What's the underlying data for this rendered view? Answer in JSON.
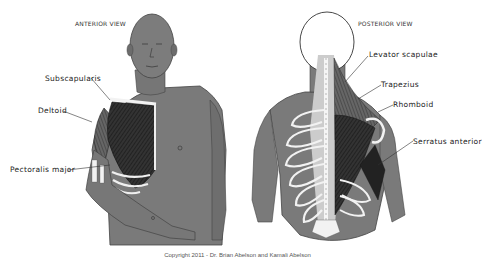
{
  "anterior": {
    "title": "ANTERIOR VIEW",
    "labels": [
      {
        "id": "subscapularis",
        "text": "Subscapularis"
      },
      {
        "id": "deltoid",
        "text": "Deltoid"
      },
      {
        "id": "pectoralis-major",
        "text": "Pectoralis major"
      }
    ]
  },
  "posterior": {
    "title": "POSTERIOR VIEW",
    "labels": [
      {
        "id": "levator-scapulae",
        "text": "Levator scapulae"
      },
      {
        "id": "trapezius",
        "text": "Trapezius"
      },
      {
        "id": "rhomboid",
        "text": "Rhomboid"
      },
      {
        "id": "serratus-anterior",
        "text": "Serratus anterior"
      }
    ]
  },
  "copyright": "Copyright 2011 - Dr. Brian Abelson and Kamali Abelson",
  "colors": {
    "skin": "#7a7a7a",
    "skin_dark": "#5e5e5e",
    "muscle": "#2a2a2a",
    "bone": "#f2f2f2",
    "background": "#ffffff"
  }
}
